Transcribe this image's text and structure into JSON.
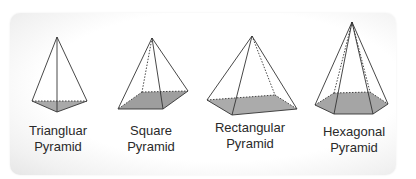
{
  "figure": {
    "background": "#ffffff",
    "base_fill": "#a9a9a9",
    "edge_color": "#333333",
    "pyramids": [
      {
        "name": "triangular",
        "line1": "Triangluar",
        "line2": "Pyramid"
      },
      {
        "name": "square",
        "line1": "Square",
        "line2": "Pyramid"
      },
      {
        "name": "rectangular",
        "line1": "Rectangular",
        "line2": "Pyramid"
      },
      {
        "name": "hexagonal",
        "line1": "Hexagonal",
        "line2": "Pyramid"
      }
    ]
  }
}
